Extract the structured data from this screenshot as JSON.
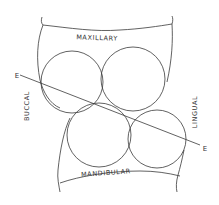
{
  "diagram": {
    "labels": {
      "maxillary": "MAXILLARY",
      "mandibular": "MANDIBULAR",
      "buccal": "BUCCAL",
      "lingual": "LINGUAL",
      "plane_start": "E",
      "plane_end": "E"
    },
    "colors": {
      "stroke": "#333333",
      "background": "#ffffff"
    }
  }
}
